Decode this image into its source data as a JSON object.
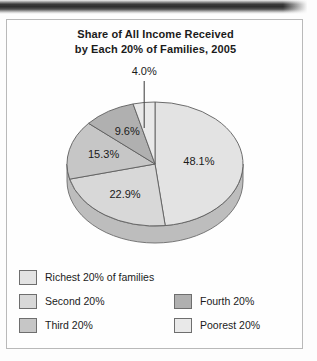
{
  "figure": {
    "title_line1": "Share of All Income Received",
    "title_line2": "by Each 20% of Families, 2005"
  },
  "chart_data": {
    "type": "pie",
    "title": "Share of All Income Received by Each 20% of Families, 2005",
    "xlabel": "",
    "ylabel": "",
    "unit": "percent",
    "three_d": true,
    "start_angle_deg": 0,
    "direction": "clockwise",
    "legend_position": "bottom",
    "grid": false,
    "total": 99.9,
    "categories": [
      "Richest 20% of families",
      "Second 20%",
      "Third 20%",
      "Fourth 20%",
      "Poorest 20%"
    ],
    "values": [
      48.1,
      22.9,
      15.3,
      9.6,
      4.0
    ],
    "labels": [
      "48.1%",
      "22.9%",
      "15.3%",
      "9.6%",
      "4.0%"
    ],
    "colors": [
      "#e3e3e3",
      "#d8d8d8",
      "#c6c6c6",
      "#b0b0b0",
      "#e9e9e9"
    ],
    "slices": [
      {
        "name": "Richest 20% of families",
        "value": 48.1,
        "label": "48.1%",
        "color": "#e3e3e3",
        "label_placement": "inside"
      },
      {
        "name": "Second 20%",
        "value": 22.9,
        "label": "22.9%",
        "color": "#d8d8d8",
        "label_placement": "inside"
      },
      {
        "name": "Third 20%",
        "value": 15.3,
        "label": "15.3%",
        "color": "#c6c6c6",
        "label_placement": "inside"
      },
      {
        "name": "Fourth 20%",
        "value": 9.6,
        "label": "9.6%",
        "color": "#b0b0b0",
        "label_placement": "inside"
      },
      {
        "name": "Poorest 20%",
        "value": 4.0,
        "label": "4.0%",
        "color": "#e9e9e9",
        "label_placement": "callout"
      }
    ]
  },
  "legend": {
    "left_column": [
      {
        "label": "Richest 20% of families",
        "color": "#e3e3e3"
      },
      {
        "label": "Second 20%",
        "color": "#d8d8d8"
      },
      {
        "label": "Third 20%",
        "color": "#c6c6c6"
      }
    ],
    "right_column": [
      {
        "label": "Fourth 20%",
        "color": "#b0b0b0"
      },
      {
        "label": "Poorest 20%",
        "color": "#e9e9e9"
      }
    ]
  }
}
